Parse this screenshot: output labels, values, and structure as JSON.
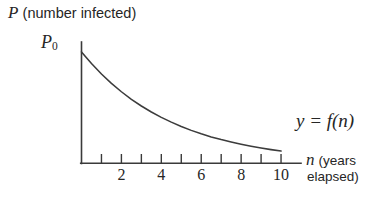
{
  "chart_data": {
    "type": "line",
    "title": "",
    "ylabel_math": "P",
    "ylabel_text": " (number infected)",
    "xlabel_math": "n",
    "xlabel_text_line1": " (years",
    "xlabel_text_line2": "elapsed)",
    "y_intercept_label": "P",
    "y_intercept_sub": "0",
    "curve_label": "y = f(n)",
    "grid": false,
    "legend_position": "inline-right",
    "xlim": [
      0,
      11
    ],
    "ylim": [
      0,
      1.08
    ],
    "x_ticks": [
      1,
      2,
      3,
      4,
      5,
      6,
      7,
      8,
      9,
      10
    ],
    "x_tick_labels": [
      {
        "x": 2,
        "label": "2"
      },
      {
        "x": 4,
        "label": "4"
      },
      {
        "x": 6,
        "label": "6"
      },
      {
        "x": 8,
        "label": "8"
      },
      {
        "x": 10,
        "label": "10"
      }
    ],
    "y_ticks": [],
    "series": [
      {
        "name": "f(n)",
        "form": "exponential decay",
        "color": "#3c3c3c",
        "x": [
          0,
          0.5,
          1,
          1.5,
          2,
          2.5,
          3,
          3.5,
          4,
          4.5,
          5,
          5.5,
          6,
          6.5,
          7,
          7.5,
          8,
          8.5,
          9,
          9.5,
          10
        ],
        "y": [
          1.0,
          0.895,
          0.801,
          0.717,
          0.642,
          0.574,
          0.514,
          0.46,
          0.412,
          0.369,
          0.33,
          0.295,
          0.264,
          0.236,
          0.212,
          0.19,
          0.17,
          0.152,
          0.136,
          0.122,
          0.109
        ]
      }
    ]
  },
  "axes": {
    "x_axis_name": "horizontal-axis",
    "y_axis_name": "vertical-axis"
  }
}
